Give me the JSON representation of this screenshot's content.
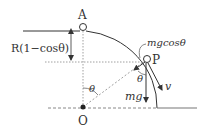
{
  "diagram": {
    "type": "physics-free-body-diagram",
    "labels": {
      "point_a": "A",
      "point_p": "P",
      "point_o": "O",
      "height_drop": "R(1−cosθ)",
      "normal_component": "mgcosθ",
      "gravity": "mg",
      "velocity": "v",
      "angle_center": "θ",
      "angle_at_p": "θ"
    },
    "colors": {
      "line": "#333333",
      "dashed": "#888888",
      "ground": "#777777",
      "background": "#ffffff"
    }
  }
}
